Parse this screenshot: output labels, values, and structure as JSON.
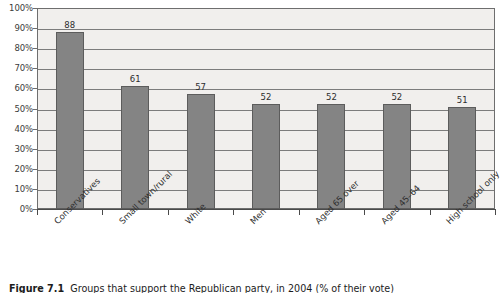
{
  "chart_data": {
    "type": "bar",
    "title": "",
    "xlabel": "",
    "ylabel": "",
    "ylim": [
      0,
      100
    ],
    "grid": true,
    "legend": "none",
    "orientation": "vertical",
    "bar_color": "#848484",
    "plot_background": "#f1efed",
    "categories": [
      "Conservatives",
      "Small town/rural",
      "White",
      "Men",
      "Aged 65 over",
      "Aged 45–64",
      "High school only"
    ],
    "values": [
      88,
      61,
      57,
      52,
      52,
      52,
      51
    ],
    "value_labels": [
      "88",
      "61",
      "57",
      "52",
      "52",
      "52",
      "51"
    ],
    "ytick_labels": [
      "100%",
      "90%",
      "80%",
      "70%",
      "60%",
      "50%",
      "40%",
      "30%",
      "20%",
      "10%",
      "0%"
    ],
    "ytick_values": [
      100,
      90,
      80,
      70,
      60,
      50,
      40,
      30,
      20,
      10,
      0
    ]
  },
  "caption": {
    "label": "Figure 7.1",
    "text": "Groups that support the Republican party, in 2004 (% of their vote)"
  }
}
